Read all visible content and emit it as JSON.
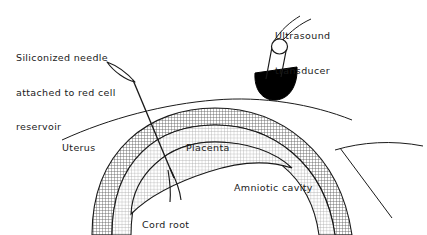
{
  "figure": {
    "type": "medical-diagram",
    "background_color": "#ffffff",
    "ink_color": "#1a1a1a"
  },
  "labels": {
    "needle": {
      "text": "Siliconized needle\nattached to red cell\nreservoir",
      "line1": "Siliconized needle",
      "line2": "attached to red cell",
      "line3": "reservoir"
    },
    "transducer": {
      "text": "Ultrasound\ntransducer",
      "line1": "Ultrasound",
      "line2": "transducer"
    },
    "uterus": {
      "text": "Uterus"
    },
    "placenta": {
      "text": "Placenta"
    },
    "amniotic_cavity": {
      "text": "Amniotic cavity"
    },
    "cord_root": {
      "text": "Cord root\n(umbilical vein)",
      "line1": "Cord root",
      "line2": "(umbilical vein)"
    }
  },
  "structures": {
    "uterine_wall": {
      "name": "uterus-wall-band",
      "fill": "crosshatch",
      "shade": "#6e6e6e"
    },
    "placenta_band": {
      "name": "placenta-band",
      "fill": "stipple",
      "shade": "#9a9a9a"
    },
    "amniotic_cavity": {
      "name": "amniotic-cavity",
      "fill": "#ffffff"
    },
    "abdominal_wall_line": {
      "name": "abdominal-wall-line"
    },
    "needle": {
      "name": "siliconized-needle",
      "tip": "beveled-hub"
    },
    "transducer": {
      "name": "ultrasound-transducer",
      "head_color": "#000000",
      "barrel": "open-cylinder"
    },
    "cord_root_vessels": {
      "name": "cord-root-vessels",
      "branches": 2
    }
  }
}
